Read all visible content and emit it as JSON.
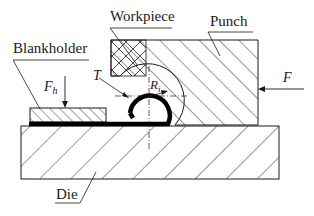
{
  "diagram": {
    "labels": {
      "workpiece": "Workpiece",
      "punch": "Punch",
      "blankholder": "Blankholder",
      "die": "Die",
      "blank_force_main": "F",
      "blank_force_sub": "h",
      "force": "F",
      "thickness": "T",
      "radius_main": "R",
      "radius_sub": "i"
    },
    "colors": {
      "stroke": "#1a1a1a",
      "background": "#ffffff"
    }
  }
}
